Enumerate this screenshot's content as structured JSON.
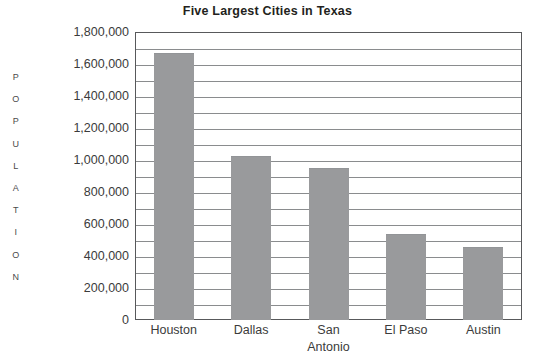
{
  "chart_data": {
    "type": "bar",
    "title": "Five Largest Cities in Texas",
    "xlabel": "",
    "ylabel": "POPULATION",
    "categories": [
      "Houston",
      "Dallas",
      "San Antonio",
      "El Paso",
      "Austin"
    ],
    "category_lines": [
      [
        "Houston"
      ],
      [
        "Dallas"
      ],
      [
        "San",
        "Antonio"
      ],
      [
        "El Paso"
      ],
      [
        "Austin"
      ]
    ],
    "values": [
      1660000,
      1020000,
      945000,
      530000,
      450000
    ],
    "ylim": [
      0,
      1800000
    ],
    "ytick_values": [
      0,
      200000,
      400000,
      600000,
      800000,
      1000000,
      1200000,
      1400000,
      1600000,
      1800000
    ],
    "ytick_labels": [
      "0",
      "200,000",
      "400,000",
      "600,000",
      "800,000",
      "1,000,000",
      "1,200,000",
      "1,400,000",
      "1,600,000",
      "1,800,000"
    ],
    "minor_tick_step": 100000,
    "grid": true,
    "grid_orientation": "horizontal",
    "legend": null,
    "bar_color": "#999a9c",
    "grid_color": "#8a8c8e",
    "frame_color": "#58595b",
    "text_color": "#3b3b3b"
  },
  "ylabel_letters": [
    "P",
    "O",
    "P",
    "U",
    "L",
    "A",
    "T",
    "I",
    "O",
    "N"
  ]
}
